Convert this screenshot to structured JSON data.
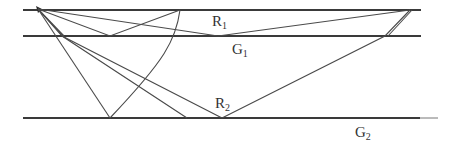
{
  "diagram": {
    "type": "seismic-ray-paths",
    "labels": {
      "R1": {
        "base": "R",
        "sub": "1"
      },
      "G1": {
        "base": "G",
        "sub": "1"
      },
      "R2": {
        "base": "R",
        "sub": "2"
      },
      "G2": {
        "base": "G",
        "sub": "2"
      }
    },
    "source_point": {
      "x": 38,
      "y": 9
    },
    "interfaces": [
      {
        "name": "surface",
        "y": 10,
        "x1": 23,
        "x2": 421
      },
      {
        "name": "G1",
        "y": 36,
        "x1": 23,
        "x2": 421
      },
      {
        "name": "G2",
        "y": 118,
        "x1": 23,
        "x2": 438
      }
    ],
    "colors": {
      "line": "#3a3a3a",
      "ray": "#4a4a4a",
      "text": "#333333",
      "background": "#ffffff"
    }
  }
}
